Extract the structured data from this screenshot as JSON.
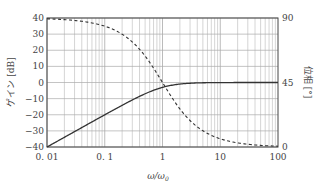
{
  "chart_data": {
    "type": "line",
    "title": "",
    "xlabel": "ω/ω0",
    "xscale": "log",
    "xlim": [
      0.01,
      100
    ],
    "x_ticks": [
      "0.01",
      "0.1",
      "1",
      "10",
      "100"
    ],
    "ylabel_left": "ゲイン [dB]",
    "ylim_left": [
      -40,
      40
    ],
    "y_ticks_left": [
      "40",
      "30",
      "20",
      "10",
      "0",
      "-10",
      "-20",
      "-30",
      "-40"
    ],
    "ylabel_right": "位相 [°]",
    "ylim_right": [
      0,
      90
    ],
    "y_ticks_right": [
      "90",
      "45",
      "0"
    ],
    "grid": true,
    "legend": null,
    "series": [
      {
        "name": "gain",
        "axis": "left",
        "style": "solid",
        "x": [
          0.01,
          0.02,
          0.05,
          0.1,
          0.2,
          0.5,
          1,
          2,
          5,
          10,
          20,
          50,
          100
        ],
        "values": [
          -40,
          -34,
          -26,
          -20,
          -14.2,
          -7,
          -3,
          -1,
          -0.2,
          0,
          0,
          0,
          0
        ]
      },
      {
        "name": "phase",
        "axis": "right",
        "style": "dashed",
        "x": [
          0.01,
          0.02,
          0.05,
          0.1,
          0.2,
          0.5,
          1,
          2,
          5,
          10,
          20,
          50,
          100
        ],
        "values": [
          89.4,
          88.9,
          87.1,
          84.3,
          78.7,
          63.4,
          45,
          26.6,
          11.3,
          5.7,
          2.9,
          1.1,
          0.6
        ]
      }
    ]
  },
  "axes": {
    "x_label_main": "ω/ω",
    "x_label_sub": "0",
    "left_label": "ゲイン [dB]",
    "right_label": "位相 [°]"
  },
  "colors": {
    "line": "#333333",
    "grid": "#aaaaaa",
    "frame": "#444444"
  }
}
